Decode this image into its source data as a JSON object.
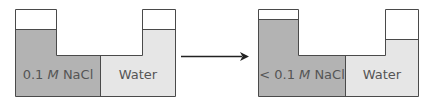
{
  "colors": {
    "salt": "#b3b3b3",
    "water": "#e6e6e6",
    "outline": "#4a4a4a",
    "empty": "#ffffff",
    "arrow": "#222222",
    "text": "#555555"
  },
  "before": {
    "left_label_prefix": "0.1 ",
    "left_label_unit": "M",
    "left_label_suffix": " NaCl",
    "right_label": "Water"
  },
  "after": {
    "left_label_prefix": "< 0.1 ",
    "left_label_unit": "M",
    "left_label_suffix": " NaCl",
    "right_label": "Water"
  },
  "arrow": {
    "direction": "right"
  }
}
